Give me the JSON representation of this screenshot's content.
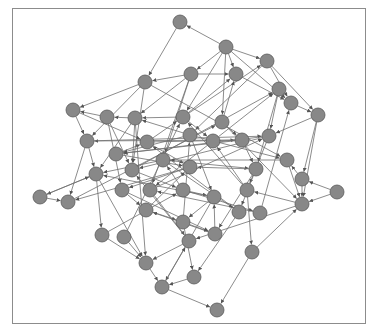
{
  "diagram": {
    "type": "directed-network-graph",
    "frame": {
      "x": 12,
      "y": 8,
      "width": 353,
      "height": 315
    },
    "style": {
      "node_fill": "#888888",
      "node_stroke": "#5a5a5a",
      "edge_color": "#6e6e6e",
      "frame_color": "#8c8c8c",
      "node_radius": 7
    },
    "nodes": [
      {
        "id": 0,
        "x": 180,
        "y": 22
      },
      {
        "id": 1,
        "x": 226,
        "y": 47
      },
      {
        "id": 2,
        "x": 267,
        "y": 61
      },
      {
        "id": 3,
        "x": 191,
        "y": 74
      },
      {
        "id": 4,
        "x": 236,
        "y": 74
      },
      {
        "id": 5,
        "x": 145,
        "y": 82
      },
      {
        "id": 6,
        "x": 279,
        "y": 89
      },
      {
        "id": 7,
        "x": 291,
        "y": 103
      },
      {
        "id": 8,
        "x": 318,
        "y": 115
      },
      {
        "id": 9,
        "x": 73,
        "y": 110
      },
      {
        "id": 10,
        "x": 107,
        "y": 117
      },
      {
        "id": 11,
        "x": 135,
        "y": 118
      },
      {
        "id": 12,
        "x": 183,
        "y": 117
      },
      {
        "id": 13,
        "x": 222,
        "y": 122
      },
      {
        "id": 14,
        "x": 87,
        "y": 141
      },
      {
        "id": 15,
        "x": 147,
        "y": 142
      },
      {
        "id": 16,
        "x": 190,
        "y": 135
      },
      {
        "id": 17,
        "x": 213,
        "y": 141
      },
      {
        "id": 18,
        "x": 242,
        "y": 140
      },
      {
        "id": 19,
        "x": 269,
        "y": 136
      },
      {
        "id": 20,
        "x": 116,
        "y": 154
      },
      {
        "id": 21,
        "x": 163,
        "y": 160
      },
      {
        "id": 22,
        "x": 190,
        "y": 167
      },
      {
        "id": 23,
        "x": 96,
        "y": 174
      },
      {
        "id": 24,
        "x": 132,
        "y": 170
      },
      {
        "id": 25,
        "x": 287,
        "y": 160
      },
      {
        "id": 26,
        "x": 256,
        "y": 169
      },
      {
        "id": 27,
        "x": 302,
        "y": 179
      },
      {
        "id": 28,
        "x": 122,
        "y": 190
      },
      {
        "id": 29,
        "x": 150,
        "y": 190
      },
      {
        "id": 30,
        "x": 183,
        "y": 190
      },
      {
        "id": 31,
        "x": 247,
        "y": 190
      },
      {
        "id": 32,
        "x": 214,
        "y": 197
      },
      {
        "id": 33,
        "x": 40,
        "y": 197
      },
      {
        "id": 34,
        "x": 68,
        "y": 202
      },
      {
        "id": 35,
        "x": 337,
        "y": 192
      },
      {
        "id": 36,
        "x": 302,
        "y": 204
      },
      {
        "id": 37,
        "x": 146,
        "y": 210
      },
      {
        "id": 38,
        "x": 239,
        "y": 212
      },
      {
        "id": 39,
        "x": 260,
        "y": 213
      },
      {
        "id": 40,
        "x": 183,
        "y": 222
      },
      {
        "id": 41,
        "x": 102,
        "y": 235
      },
      {
        "id": 42,
        "x": 124,
        "y": 237
      },
      {
        "id": 43,
        "x": 189,
        "y": 241
      },
      {
        "id": 44,
        "x": 215,
        "y": 234
      },
      {
        "id": 45,
        "x": 252,
        "y": 252
      },
      {
        "id": 46,
        "x": 146,
        "y": 263
      },
      {
        "id": 47,
        "x": 194,
        "y": 277
      },
      {
        "id": 48,
        "x": 162,
        "y": 287
      },
      {
        "id": 49,
        "x": 217,
        "y": 310
      }
    ],
    "edges": [
      [
        1,
        0
      ],
      [
        0,
        5
      ],
      [
        1,
        2
      ],
      [
        1,
        3
      ],
      [
        1,
        7
      ],
      [
        1,
        4
      ],
      [
        1,
        12
      ],
      [
        1,
        13
      ],
      [
        2,
        8
      ],
      [
        2,
        7
      ],
      [
        2,
        16
      ],
      [
        3,
        5
      ],
      [
        3,
        4
      ],
      [
        4,
        7
      ],
      [
        5,
        9
      ],
      [
        5,
        14
      ],
      [
        5,
        24
      ],
      [
        5,
        25
      ],
      [
        3,
        11
      ],
      [
        3,
        21
      ],
      [
        3,
        29
      ],
      [
        9,
        14
      ],
      [
        14,
        23
      ],
      [
        14,
        34
      ],
      [
        10,
        24
      ],
      [
        10,
        28
      ],
      [
        11,
        10
      ],
      [
        11,
        24
      ],
      [
        11,
        23
      ],
      [
        12,
        11
      ],
      [
        12,
        2
      ],
      [
        12,
        17
      ],
      [
        13,
        4
      ],
      [
        13,
        18
      ],
      [
        13,
        36
      ],
      [
        6,
        19
      ],
      [
        6,
        26
      ],
      [
        7,
        8
      ],
      [
        8,
        27
      ],
      [
        8,
        36
      ],
      [
        8,
        19
      ],
      [
        15,
        12
      ],
      [
        15,
        22
      ],
      [
        15,
        18
      ],
      [
        16,
        11
      ],
      [
        16,
        20
      ],
      [
        16,
        25
      ],
      [
        17,
        6
      ],
      [
        17,
        29
      ],
      [
        18,
        14
      ],
      [
        18,
        20
      ],
      [
        19,
        24
      ],
      [
        19,
        31
      ],
      [
        20,
        15
      ],
      [
        20,
        22
      ],
      [
        21,
        23
      ],
      [
        21,
        26
      ],
      [
        22,
        28
      ],
      [
        22,
        34
      ],
      [
        23,
        33
      ],
      [
        23,
        41
      ],
      [
        23,
        46
      ],
      [
        24,
        6
      ],
      [
        25,
        21
      ],
      [
        25,
        36
      ],
      [
        26,
        22
      ],
      [
        26,
        38
      ],
      [
        27,
        36
      ],
      [
        27,
        25
      ],
      [
        28,
        37
      ],
      [
        28,
        44
      ],
      [
        29,
        19
      ],
      [
        29,
        43
      ],
      [
        30,
        21
      ],
      [
        30,
        32
      ],
      [
        30,
        39
      ],
      [
        31,
        17
      ],
      [
        31,
        45
      ],
      [
        32,
        23
      ],
      [
        32,
        40
      ],
      [
        32,
        48
      ],
      [
        33,
        34
      ],
      [
        34,
        13
      ],
      [
        35,
        36
      ],
      [
        36,
        31
      ],
      [
        36,
        43
      ],
      [
        37,
        40
      ],
      [
        38,
        15
      ],
      [
        38,
        47
      ],
      [
        39,
        7
      ],
      [
        39,
        29
      ],
      [
        40,
        47
      ],
      [
        40,
        16
      ],
      [
        41,
        46
      ],
      [
        42,
        46
      ],
      [
        42,
        12
      ],
      [
        43,
        46
      ],
      [
        43,
        24
      ],
      [
        44,
        37
      ],
      [
        44,
        32
      ],
      [
        45,
        49
      ],
      [
        45,
        36
      ],
      [
        46,
        48
      ],
      [
        47,
        48
      ],
      [
        48,
        49
      ],
      [
        48,
        43
      ],
      [
        41,
        30
      ],
      [
        33,
        23
      ],
      [
        9,
        15
      ],
      [
        10,
        9
      ],
      [
        35,
        27
      ],
      [
        26,
        44
      ],
      [
        31,
        12
      ],
      [
        19,
        20
      ],
      [
        16,
        32
      ],
      [
        21,
        38
      ],
      [
        37,
        22
      ],
      [
        24,
        30
      ],
      [
        40,
        44
      ],
      [
        14,
        19
      ],
      [
        12,
        4
      ],
      [
        18,
        26
      ],
      [
        11,
        46
      ]
    ]
  }
}
